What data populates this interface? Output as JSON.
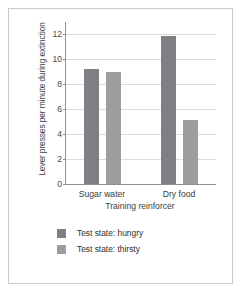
{
  "chart_data": {
    "type": "bar",
    "title": "",
    "xlabel": "Training reinforcer",
    "ylabel": "Lever presses per minute during extinction",
    "categories": [
      "Sugar water",
      "Dry food"
    ],
    "series": [
      {
        "name": "Test state: hungry",
        "color": "#7e8083",
        "values": [
          9.2,
          11.9
        ]
      },
      {
        "name": "Test state: thirsty",
        "color": "#9b9d9f",
        "values": [
          9.0,
          5.1
        ]
      }
    ],
    "ylim": [
      0,
      13
    ],
    "yticks": [
      0,
      2,
      4,
      6,
      8,
      10,
      12
    ],
    "ytick_labels": [
      "0",
      "2",
      "4",
      "6",
      "8",
      "10",
      "12"
    ],
    "grid": true,
    "grid_axis": "y",
    "legend_position": "bottom-left"
  },
  "legend": {
    "items": [
      {
        "label": "Test state: hungry",
        "swatch": "hungry"
      },
      {
        "label": "Test state: thirsty",
        "swatch": "thirsty"
      }
    ]
  },
  "colors": {
    "hungry": "#7e8083",
    "thirsty": "#9b9d9f",
    "axis": "#8d9093",
    "grid": "#d9dbdc",
    "frame": "#c9ccce",
    "background": "#ffffff"
  }
}
